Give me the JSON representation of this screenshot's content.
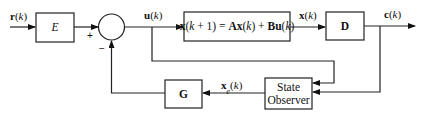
{
  "diagram": {
    "type": "block-diagram",
    "title": "",
    "signals": {
      "input": {
        "bold": "r",
        "arg": "(",
        "var": "k",
        "close": ")"
      },
      "control": {
        "bold": "u",
        "arg": "(",
        "var": "k",
        "close": ")"
      },
      "state": {
        "bold": "x",
        "arg": "(",
        "var": "k",
        "close": ")"
      },
      "output": {
        "bold": "c",
        "arg": "(",
        "var": "k",
        "close": ")"
      },
      "estimate": {
        "bold": "x",
        "sub": "e",
        "arg": "(",
        "var": "k",
        "close": ")"
      }
    },
    "blocks": {
      "prefilter": {
        "label": "E"
      },
      "plant": {
        "label_parts": [
          "x",
          "(",
          "k",
          " + 1) = ",
          "Ax",
          "(",
          "k",
          ") + ",
          "Bu",
          "(",
          "k",
          ")"
        ]
      },
      "output_matrix": {
        "label": "D"
      },
      "gain": {
        "label": "G"
      },
      "observer": {
        "line1": "State",
        "line2": "Observer"
      }
    },
    "summing_junction": {
      "plus": "+",
      "minus": "−"
    },
    "connections": [
      {
        "from": "r(k)",
        "to": "E"
      },
      {
        "from": "E",
        "to": "summing_junction",
        "sign": "+"
      },
      {
        "from": "summing_junction",
        "to": "plant",
        "signal": "u(k)"
      },
      {
        "from": "plant",
        "to": "D",
        "signal": "x(k)"
      },
      {
        "from": "D",
        "to": "output",
        "signal": "c(k)"
      },
      {
        "from": "u(k)",
        "to": "State Observer"
      },
      {
        "from": "c(k)",
        "to": "State Observer"
      },
      {
        "from": "State Observer",
        "to": "G",
        "signal": "xe(k)"
      },
      {
        "from": "G",
        "to": "summing_junction",
        "sign": "−"
      }
    ]
  }
}
